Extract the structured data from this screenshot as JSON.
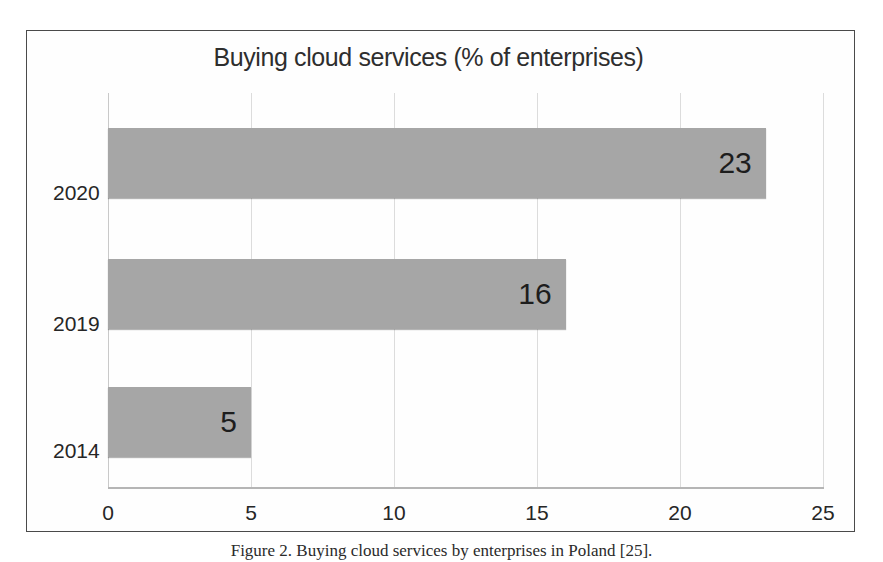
{
  "figure": {
    "caption": "Figure 2. Buying cloud services by enterprises in Poland [25]."
  },
  "chart_data": {
    "type": "bar",
    "orientation": "horizontal",
    "title": "Buying cloud services (% of enterprises)",
    "xlabel": "",
    "ylabel": "",
    "categories": [
      "2020",
      "2019",
      "2014"
    ],
    "values": [
      23,
      16,
      5
    ],
    "data_labels": [
      "23",
      "16",
      "5"
    ],
    "xlim": [
      0,
      25
    ],
    "xticks": [
      0,
      5,
      10,
      15,
      20,
      25
    ],
    "xtick_labels": [
      "0",
      "5",
      "10",
      "15",
      "20",
      "25"
    ],
    "grid": "vertical",
    "legend": "none",
    "series": [
      {
        "name": "Buying cloud services (% of enterprises)",
        "values": [
          23,
          16,
          5
        ]
      }
    ],
    "colors": {
      "bar_fill": "#a6a6a6",
      "gridline": "#dcdcdc",
      "text": "#262626",
      "frame": "#4a4a4a",
      "background": "#ffffff"
    }
  }
}
